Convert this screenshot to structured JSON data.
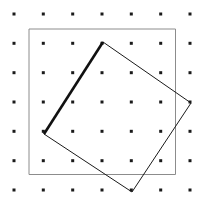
{
  "figure": {
    "background_color": "#ffffff",
    "width": 203,
    "height": 204
  },
  "chart_data": {
    "type": "scatter",
    "title": "",
    "xlabel": "",
    "ylabel": "",
    "xlim": [
      0,
      203
    ],
    "ylim": [
      0,
      204
    ],
    "grid": false,
    "legend": null,
    "lattice": {
      "name": "dot-grid",
      "rows": 7,
      "cols": 7,
      "x_positions": [
        14,
        43.3,
        72.7,
        102,
        131.3,
        160.7,
        190
      ],
      "y_positions": [
        14,
        43.3,
        72.7,
        102,
        131.3,
        160.7,
        190
      ],
      "dot_size": 3,
      "dot_color": "#1a1a1a",
      "dot_shape": "square"
    },
    "shapes": [
      {
        "name": "outer-square",
        "type": "polygon",
        "closed": true,
        "points": [
          [
            29,
            29
          ],
          [
            175.5,
            29
          ],
          [
            175.5,
            174.5
          ],
          [
            29,
            174.5
          ]
        ],
        "stroke": "#8c8c8c",
        "stroke_width": 1,
        "fill": "none"
      },
      {
        "name": "tilted-square",
        "type": "polygon",
        "closed": true,
        "points": [
          [
            103,
            42
          ],
          [
            191,
            103
          ],
          [
            132,
            192
          ],
          [
            44,
            134
          ]
        ],
        "stroke": "#1a1a1a",
        "stroke_width": 1,
        "fill": "none",
        "vertex_labels": [
          "top",
          "right",
          "bottom",
          "left"
        ]
      },
      {
        "name": "highlighted-edge",
        "type": "line",
        "points": [
          [
            44,
            134
          ],
          [
            103,
            42
          ]
        ],
        "stroke": "#111111",
        "stroke_width": 2.6,
        "emphasis": "bold"
      }
    ]
  }
}
